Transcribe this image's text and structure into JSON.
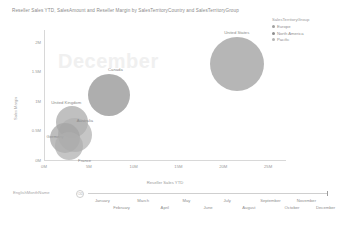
{
  "chart_data": {
    "type": "scatter",
    "title": "Reseller Sales YTD, SalesAmount and Reseller Margin by SalesTerritoryCountry and SalesTerritoryGroup",
    "xlabel": "Reseller Sales YTD",
    "ylabel": "Sales Margin",
    "xlim": [
      0,
      27000000
    ],
    "ylim": [
      0,
      2200000
    ],
    "xticks": [
      "0M",
      "5M",
      "10M",
      "15M",
      "20M",
      "25M"
    ],
    "xtick_values": [
      0,
      5000000,
      10000000,
      15000000,
      20000000,
      25000000
    ],
    "yticks": [
      "2M",
      "1.5M",
      "1M",
      "0.5M",
      "0M"
    ],
    "ytick_values": [
      2000000,
      1500000,
      1000000,
      500000,
      0
    ],
    "grid": false,
    "legend_position": "top-right",
    "legend_title": "SalesTerritoryGroup",
    "legend_entries": [
      {
        "label": "Europe",
        "color": "#a0a0a0"
      },
      {
        "label": "North America",
        "color": "#8e8e8e"
      },
      {
        "label": "Pacific",
        "color": "#b4b4b4"
      }
    ],
    "watermark": "December",
    "points": [
      {
        "label": "United States",
        "group": "North America",
        "x": 21500000,
        "y": 1620000,
        "size": 27,
        "color": "#9a9a9a",
        "label_dx": 0,
        "label_dy": -32
      },
      {
        "label": "Canada",
        "group": "North America",
        "x": 7300000,
        "y": 1100000,
        "size": 21,
        "color": "#8f8f8f",
        "label_dx": 6,
        "label_dy": -26
      },
      {
        "label": "United Kingdom",
        "group": "Europe",
        "x": 3150000,
        "y": 640000,
        "size": 16,
        "color": "#a8a8a8",
        "label_dx": -6,
        "label_dy": -20
      },
      {
        "label": "Australia",
        "group": "Pacific",
        "x": 3450000,
        "y": 420000,
        "size": 17,
        "color": "#b0b0b0",
        "label_dx": 10,
        "label_dy": -15
      },
      {
        "label": "Germany",
        "group": "Europe",
        "x": 2350000,
        "y": 370000,
        "size": 15,
        "color": "#a4a4a4",
        "label_dx": -10,
        "label_dy": -2
      },
      {
        "label": "France",
        "group": "Europe",
        "x": 2750000,
        "y": 230000,
        "size": 14,
        "color": "#aeaeae",
        "label_dx": 16,
        "label_dy": 14
      }
    ]
  },
  "slicer": {
    "label": "EnglishMonthName",
    "eraser_icon": "eraser-icon",
    "eraser_glyph": "⌫",
    "months": [
      {
        "name": "January",
        "pos": 6,
        "row": 0
      },
      {
        "name": "February",
        "pos": 14,
        "row": 1
      },
      {
        "name": "March",
        "pos": 23,
        "row": 0
      },
      {
        "name": "April",
        "pos": 32,
        "row": 1
      },
      {
        "name": "May",
        "pos": 41,
        "row": 0
      },
      {
        "name": "June",
        "pos": 50,
        "row": 1
      },
      {
        "name": "July",
        "pos": 58,
        "row": 0
      },
      {
        "name": "August",
        "pos": 67,
        "row": 1
      },
      {
        "name": "September",
        "pos": 76,
        "row": 0
      },
      {
        "name": "October",
        "pos": 85,
        "row": 1
      },
      {
        "name": "November",
        "pos": 91,
        "row": 0
      },
      {
        "name": "December",
        "pos": 99,
        "row": 1
      }
    ]
  }
}
